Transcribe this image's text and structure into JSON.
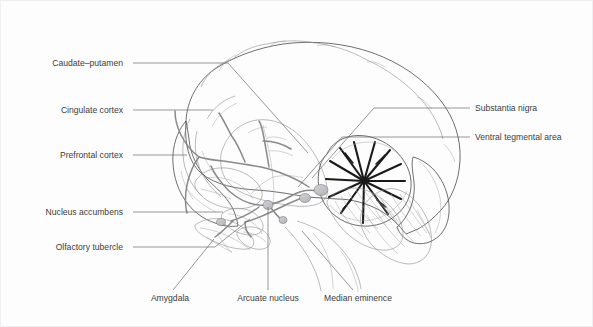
{
  "figure": {
    "background_color": "#fdfdfe",
    "border_color": "#f0f0f2",
    "label_color": "#3c3c3c",
    "leader_color": "#6b6b6b",
    "outline_color": "#4a4a4a",
    "fissure_color": "#1a1a1a",
    "structure_fill": "#dcdcde"
  },
  "labels": {
    "left": [
      {
        "id": "caudate-putamen",
        "text": "Caudate–putamen",
        "x": 127,
        "y": 65
      },
      {
        "id": "cingulate-cortex",
        "text": "Cingulate cortex",
        "x": 127,
        "y": 112
      },
      {
        "id": "prefrontal-cortex",
        "text": "Prefrontal cortex",
        "x": 127,
        "y": 157
      },
      {
        "id": "nucleus-accumbens",
        "text": "Nucleus accumbens",
        "x": 127,
        "y": 214
      },
      {
        "id": "olfactory-tubercle",
        "text": "Olfactory tubercle",
        "x": 127,
        "y": 249
      }
    ],
    "right": [
      {
        "id": "substantia-nigra",
        "text": "Substantia nigra",
        "x": 474,
        "y": 110
      },
      {
        "id": "ventral-tegmental-area",
        "text": "Ventral tegmental area",
        "x": 474,
        "y": 139
      }
    ],
    "bottom": [
      {
        "id": "amygdala",
        "text": "Amygdala",
        "x": 169,
        "y": 300
      },
      {
        "id": "arcuate-nucleus",
        "text": "Arcuate nucleus",
        "x": 267,
        "y": 300
      },
      {
        "id": "median-eminence",
        "text": "Median eminence",
        "x": 357,
        "y": 300
      }
    ]
  },
  "leader_lines": [
    {
      "id": "leader-caudate-putamen",
      "d": "M132 62 L227 62 L307 152"
    },
    {
      "id": "leader-cingulate-cortex",
      "d": "M132 109 L212 109"
    },
    {
      "id": "leader-prefrontal-cortex",
      "d": "M132 154 L186 154"
    },
    {
      "id": "leader-nucleus-accumbens",
      "d": "M132 211 L222 211"
    },
    {
      "id": "leader-olfactory-tubercle",
      "d": "M132 246 L214 246 L249 218"
    },
    {
      "id": "leader-substantia-nigra",
      "d": "M469 107 L373 107 L311 177"
    },
    {
      "id": "leader-ventral-tegmental-area",
      "d": "M469 136 L341 136 L297 186"
    },
    {
      "id": "leader-amygdala",
      "d": "M172 289 L213 238"
    },
    {
      "id": "leader-arcuate-nucleus",
      "d": "M267 289 L267 206"
    },
    {
      "id": "leader-median-eminence",
      "d": "M352 289 L301 230"
    }
  ]
}
